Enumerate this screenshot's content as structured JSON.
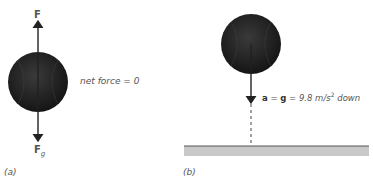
{
  "panel_a": {
    "caption": "(a)",
    "force_up_label": "F",
    "force_down_label": "F",
    "force_down_subscript": "g",
    "net_force_text": "net force = 0"
  },
  "panel_b": {
    "caption": "(b)",
    "accel_bold_a": "a",
    "accel_eq1": " = ",
    "accel_bold_g": "g",
    "accel_eq2": " = 9.8 m/s",
    "accel_sup": "2",
    "accel_tail": " down"
  },
  "colors": {
    "ball": "#2a2a2a",
    "ground": "#c8c8c8",
    "ground_edge": "#555555",
    "arrow": "#222222"
  }
}
